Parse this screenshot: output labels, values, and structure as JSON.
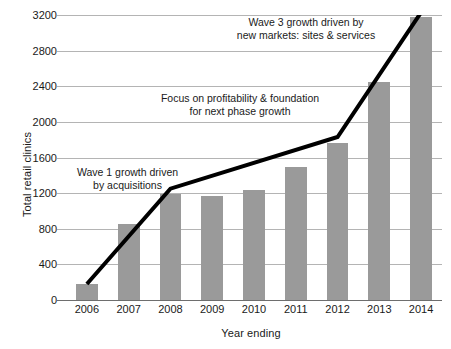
{
  "chart_data": {
    "type": "bar",
    "title": "",
    "xlabel": "Year ending",
    "ylabel": "Total retail clinics",
    "categories": [
      "2006",
      "2007",
      "2008",
      "2009",
      "2010",
      "2011",
      "2012",
      "2013",
      "2014"
    ],
    "values": [
      180,
      850,
      1190,
      1170,
      1230,
      1490,
      1760,
      2450,
      3180
    ],
    "ylim": [
      0,
      3200
    ],
    "yticks": [
      0,
      400,
      800,
      1200,
      1600,
      2000,
      2400,
      2800,
      3200
    ],
    "ytick_labels": [
      "0",
      "400",
      "800",
      "1200",
      "1600",
      "2000",
      "2400",
      "2800",
      "3200"
    ],
    "grid": true,
    "legend": false,
    "bar_color": "#9a9a9a",
    "gridline_color": "#b4b4b4",
    "axis_color": "#6e6e6e",
    "series": [
      {
        "name": "Total retail clinics",
        "values": [
          180,
          850,
          1190,
          1170,
          1230,
          1490,
          1760,
          2450,
          3180
        ]
      }
    ],
    "overlay_line": {
      "name": "growth trajectory",
      "color": "#000000",
      "width_px": 4,
      "points": [
        {
          "x": "2006",
          "y": 180
        },
        {
          "x": "2008",
          "y": 1250
        },
        {
          "x": "2012",
          "y": 1830
        },
        {
          "x": "2014",
          "y": 3230
        }
      ]
    },
    "annotations": [
      {
        "id": "wave1",
        "text": "Wave 1 growth driven\nby acquisitions",
        "x": "2007",
        "y": 1430
      },
      {
        "id": "focus",
        "text": "Focus on profitability & foundation\nfor next phase growth",
        "x": "2010",
        "y": 2280
      },
      {
        "id": "wave3",
        "text": "Wave 3 growth driven by\nnew markets: sites & services",
        "x": "2012",
        "y": 3060
      }
    ]
  },
  "axes": {
    "y_title": "Total retail clinics",
    "x_title": "Year ending"
  },
  "annotations": {
    "wave1": "Wave 1 growth driven\nby acquisitions",
    "focus": "Focus on profitability & foundation\nfor next phase growth",
    "wave3": "Wave 3 growth driven by\nnew markets: sites & services"
  }
}
